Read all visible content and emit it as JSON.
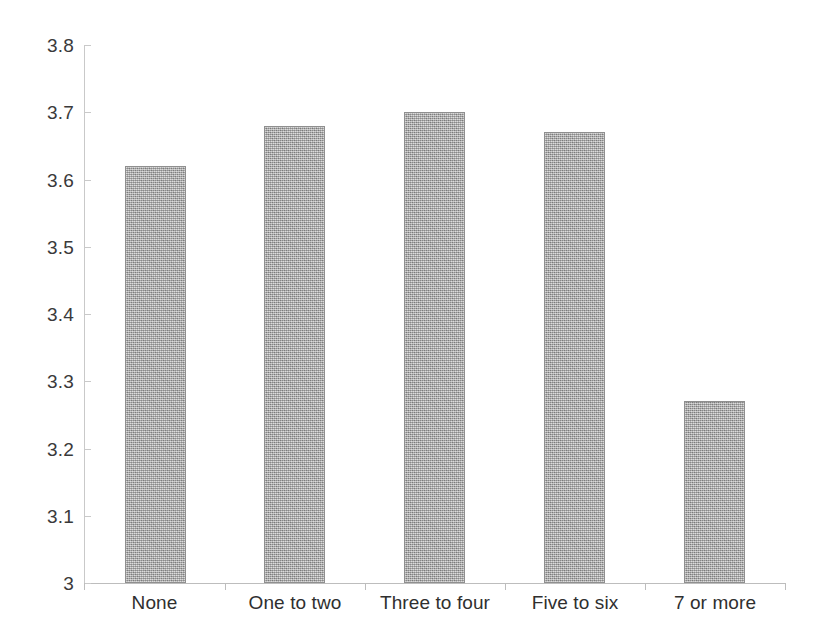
{
  "chart_data": {
    "type": "bar",
    "title": "",
    "subtitle": "",
    "xlabel": "",
    "ylabel": "",
    "categories": [
      "None",
      "One to two",
      "Three to four",
      "Five to six",
      "7 or more"
    ],
    "values": [
      3.62,
      3.68,
      3.7,
      3.67,
      3.27
    ],
    "ylim": [
      3,
      3.8
    ],
    "ytick_labels": [
      "3.8",
      "3.7",
      "3.6",
      "3.5",
      "3.4",
      "3.3",
      "3.2",
      "3.1",
      "3"
    ],
    "ytick_values": [
      3.8,
      3.7,
      3.6,
      3.5,
      3.4,
      3.3,
      3.2,
      3.1,
      3
    ],
    "grid": false,
    "legend": false,
    "legend_position": "none",
    "series": [
      {
        "name": "",
        "values": [
          3.62,
          3.68,
          3.7,
          3.67,
          3.27
        ]
      }
    ],
    "bar_fill_color": "#b4b4b4",
    "bar_border_color": "#8f8f8f",
    "axis_color": "#bdbdbd",
    "background_color": "#ffffff"
  }
}
